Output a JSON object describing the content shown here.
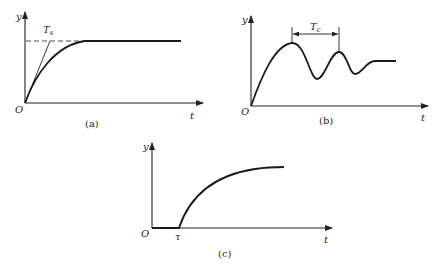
{
  "figures": [
    {
      "id": "a",
      "caption": "(a)",
      "y_label": "y",
      "x_label": "t",
      "origin_label": "O",
      "annotation": "Ts",
      "annotation_main": "T",
      "annotation_sub": "s",
      "description": "First-order step response rising exponentially to steady value, with tangent line at origin reaching steady-state (dashed) at time constant Ts"
    },
    {
      "id": "b",
      "caption": "(b)",
      "y_label": "y",
      "x_label": "t",
      "origin_label": "O",
      "annotation": "Tc",
      "annotation_main": "T",
      "annotation_sub": "c",
      "description": "Underdamped oscillatory response; Tc marked as the period between first two peaks"
    },
    {
      "id": "c",
      "caption": "(c)",
      "y_label": "y",
      "x_label": "t",
      "origin_label": "O",
      "delay_label": "τ",
      "description": "Step response with dead time τ, then exponential rise"
    }
  ]
}
